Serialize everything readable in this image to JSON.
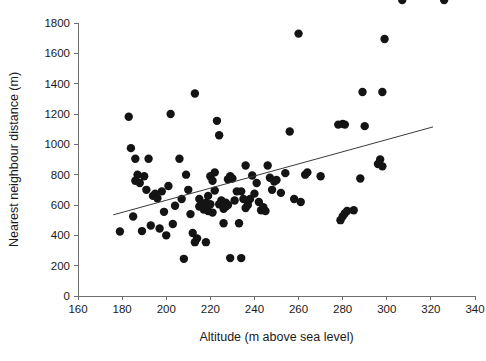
{
  "chart_data": {
    "type": "scatter",
    "title": "",
    "xlabel": "Altitude (m above sea level)",
    "ylabel": "Nearest neighbour distance (m)",
    "xlim": [
      160,
      340
    ],
    "ylim": [
      0,
      1800
    ],
    "xticks": [
      160,
      180,
      200,
      220,
      240,
      260,
      280,
      300,
      320,
      340
    ],
    "xtick_labels": [
      "160",
      "180",
      "200",
      "220",
      "240",
      "260",
      "280",
      "300",
      "320",
      "340"
    ],
    "yticks": [
      0,
      200,
      400,
      600,
      800,
      1000,
      1200,
      1400,
      1600,
      1800
    ],
    "ytick_labels": [
      "0",
      "200",
      "400",
      "600",
      "800",
      "1000",
      "1200",
      "1400",
      "1600",
      "1800"
    ],
    "grid": false,
    "legend": "none",
    "marker": "filled-circle",
    "marker_color": "#141414",
    "marker_size": 5.2,
    "trendline": {
      "type": "linear",
      "color": "#3a3a3a",
      "x_start": 176,
      "y_start": 535,
      "x_end": 321,
      "y_end": 1115
    },
    "x": [
      179,
      183,
      184,
      185,
      186,
      186,
      187,
      188,
      189,
      190,
      191,
      192,
      193,
      194,
      195,
      196,
      197,
      198,
      199,
      200,
      201,
      202,
      203,
      204,
      206,
      207,
      208,
      209,
      210,
      211,
      212,
      213,
      213,
      214,
      215,
      215,
      216,
      217,
      218,
      218,
      219,
      219,
      220,
      220,
      221,
      221,
      222,
      222,
      223,
      224,
      224,
      225,
      226,
      226,
      227,
      227,
      228,
      228,
      229,
      229,
      230,
      231,
      232,
      233,
      234,
      234,
      235,
      236,
      236,
      237,
      238,
      239,
      240,
      241,
      242,
      243,
      244,
      245,
      246,
      247,
      248,
      249,
      250,
      252,
      254,
      256,
      258,
      260,
      261,
      263,
      264,
      270,
      278,
      279,
      280,
      280,
      281,
      281,
      282,
      285,
      288,
      289,
      290,
      296,
      297,
      298,
      298,
      299,
      307,
      326
    ],
    "y": [
      425,
      1182,
      975,
      524,
      905,
      760,
      800,
      745,
      428,
      790,
      700,
      905,
      465,
      660,
      675,
      645,
      445,
      690,
      555,
      400,
      725,
      1200,
      475,
      595,
      905,
      640,
      245,
      800,
      700,
      540,
      415,
      1335,
      355,
      380,
      640,
      590,
      595,
      570,
      355,
      615,
      560,
      660,
      790,
      605,
      760,
      550,
      695,
      815,
      1155,
      1060,
      605,
      630,
      575,
      480,
      590,
      615,
      600,
      770,
      790,
      250,
      775,
      630,
      690,
      480,
      250,
      690,
      640,
      580,
      860,
      600,
      640,
      795,
      675,
      745,
      620,
      565,
      585,
      560,
      860,
      780,
      700,
      755,
      765,
      680,
      810,
      1085,
      640,
      1730,
      620,
      800,
      815,
      790,
      1130,
      500,
      525,
      1135,
      545,
      1130,
      560,
      565,
      775,
      1345,
      1120,
      870,
      900,
      855,
      1345,
      1695
    ]
  }
}
